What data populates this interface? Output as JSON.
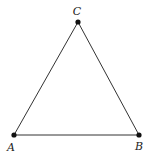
{
  "diagram": {
    "type": "triangle",
    "stroke_color": "#333333",
    "point_color": "#111111",
    "vertices": [
      {
        "id": "A",
        "label": "A",
        "x": 14,
        "y": 135,
        "label_x": 11,
        "label_y": 147
      },
      {
        "id": "B",
        "label": "B",
        "x": 139,
        "y": 135,
        "label_x": 139,
        "label_y": 146
      },
      {
        "id": "C",
        "label": "C",
        "x": 78,
        "y": 22,
        "label_x": 77,
        "label_y": 11
      }
    ],
    "edges": [
      {
        "from": "A",
        "to": "B",
        "name": "AB"
      },
      {
        "from": "B",
        "to": "C",
        "name": "BC"
      },
      {
        "from": "C",
        "to": "A",
        "name": "CA"
      }
    ]
  }
}
